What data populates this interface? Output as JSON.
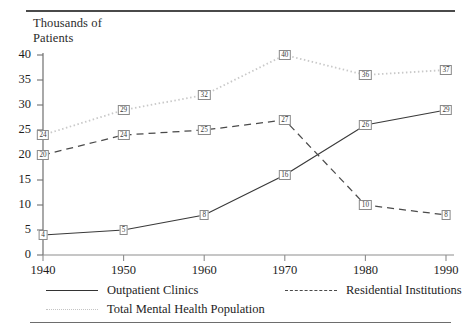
{
  "figure": {
    "y_axis_title": "Thousands of\nPatients"
  },
  "chart_data": {
    "type": "line",
    "title": "",
    "xlabel": "",
    "ylabel": "Thousands of Patients",
    "categories": [
      "1940",
      "1950",
      "1960",
      "1970",
      "1980",
      "1990"
    ],
    "x": [
      1940,
      1950,
      1960,
      1970,
      1980,
      1990
    ],
    "xlim": [
      1940,
      1990
    ],
    "ylim": [
      0,
      40
    ],
    "yticks": [
      "0",
      "5",
      "10",
      "15",
      "20",
      "25",
      "30",
      "35",
      "40"
    ],
    "ytick_values": [
      0,
      5,
      10,
      15,
      20,
      25,
      30,
      35,
      40
    ],
    "grid": false,
    "legend_position": "bottom",
    "data_labels": true,
    "series": [
      {
        "name": "Outpatient Clinics",
        "style": "solid",
        "color": "#3a3a3a",
        "values": [
          4,
          5,
          8,
          16,
          26,
          29
        ]
      },
      {
        "name": "Residential Institutions",
        "style": "dashed",
        "color": "#4a4a4a",
        "values": [
          20,
          24,
          25,
          27,
          10,
          8
        ]
      },
      {
        "name": "Total Mental Health Population",
        "style": "dotted",
        "color": "#c9c9c9",
        "values": [
          24,
          29,
          32,
          40,
          36,
          37
        ]
      }
    ]
  },
  "legend": {
    "items": [
      {
        "label": "Outpatient Clinics",
        "style": "solid"
      },
      {
        "label": "Residential Institutions",
        "style": "dashed"
      },
      {
        "label": "Total Mental Health Population",
        "style": "dotted"
      }
    ]
  }
}
